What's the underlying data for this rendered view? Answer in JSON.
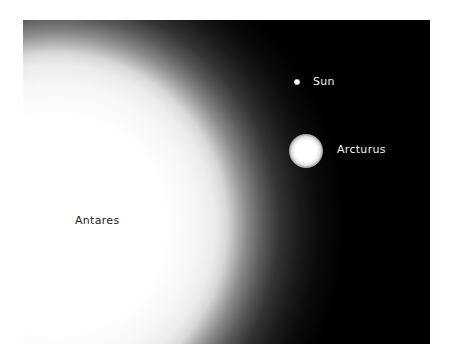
{
  "image": {
    "description": "Size comparison of stars Antares, Arcturus and the Sun",
    "background_color": "#000000",
    "stars": [
      {
        "name": "Sun",
        "label": "Sun"
      },
      {
        "name": "Arcturus",
        "label": "Arcturus"
      },
      {
        "name": "Antares",
        "label": "Antares"
      }
    ]
  }
}
